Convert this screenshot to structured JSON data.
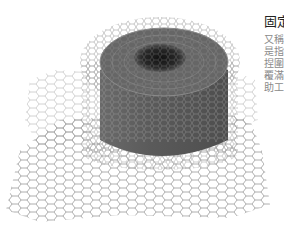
{
  "image": {
    "subject": "roll of galvanized hexagonal chicken wire mesh",
    "icon": "wire-mesh-roll-image"
  },
  "text": {
    "title": "固定",
    "lines": [
      "又稱",
      "是指",
      "捏圍",
      "覆滿",
      "助工"
    ]
  },
  "colors": {
    "background": "#ffffff",
    "wire_dark": "#4a4a4a",
    "wire_light": "#9a9a9a",
    "title": "#222222",
    "body": "#8a8a8a"
  }
}
